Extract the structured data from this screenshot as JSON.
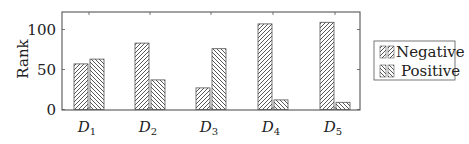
{
  "chart_data": {
    "type": "bar",
    "title": "",
    "xlabel": "",
    "ylabel": "Rank",
    "ylim": [
      0,
      122
    ],
    "yticks": [
      0,
      50,
      100
    ],
    "grid": false,
    "legend_position": "right",
    "categories": [
      "D1",
      "D2",
      "D3",
      "D4",
      "D5"
    ],
    "category_labels": [
      {
        "base": "D",
        "sub": "1"
      },
      {
        "base": "D",
        "sub": "2"
      },
      {
        "base": "D",
        "sub": "3"
      },
      {
        "base": "D",
        "sub": "4"
      },
      {
        "base": "D",
        "sub": "5"
      }
    ],
    "series": [
      {
        "name": "Negative",
        "pattern": "north-east-lines",
        "values": [
          57,
          83,
          27,
          107,
          109
        ]
      },
      {
        "name": "Positive",
        "pattern": "north-west-lines",
        "values": [
          63,
          37,
          76,
          12,
          9
        ]
      }
    ]
  },
  "colors": {
    "axis": "#555555",
    "hatch": "#444444",
    "bar_outline": "#555555",
    "background": "#ffffff"
  }
}
